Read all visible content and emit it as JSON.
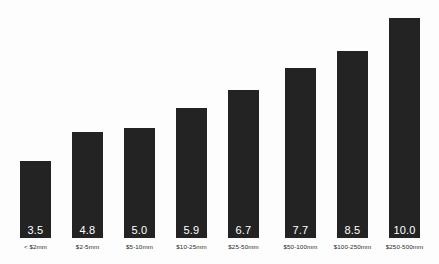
{
  "chart_data": {
    "type": "bar",
    "title": "",
    "subtitle": "",
    "xlabel": "",
    "ylabel": "",
    "grid": false,
    "legend": false,
    "ylim": [
      0,
      10.8
    ],
    "categories": [
      "< $2mm",
      "$2-5mm",
      "$5-10mm",
      "$10-25mm",
      "$25-50mm",
      "$50-100mm",
      "$100-250mm",
      "$250-500mm"
    ],
    "values": [
      3.5,
      4.8,
      5.0,
      5.9,
      6.7,
      7.7,
      8.5,
      10.0
    ],
    "value_labels": [
      "3.5",
      "4.8",
      "5.0",
      "5.9",
      "6.7",
      "7.7",
      "8.5",
      "10.0"
    ],
    "bar_color": "#232323",
    "value_label_color": "#ffffff",
    "category_label_color": "#2a2a2a",
    "background_color": "#fdfdfd"
  }
}
